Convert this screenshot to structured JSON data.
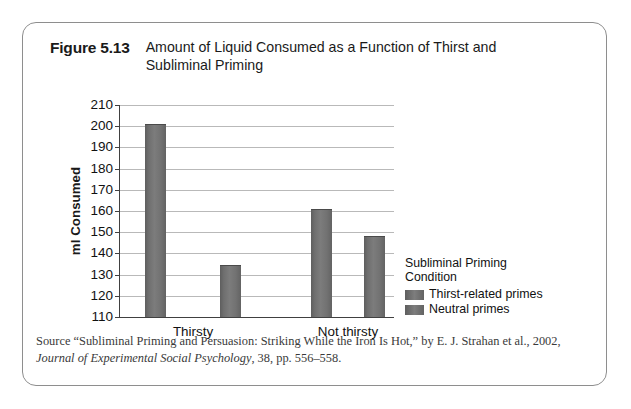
{
  "figure": {
    "number": "Figure 5.13",
    "title": "Amount of Liquid Consumed as a Function of Thirst and Subliminal Priming"
  },
  "source": {
    "lead": "Source “Subliminal Priming and Persuasion: Striking While the Iron Is Hot,” by E. J. Strahan et al., 2002,",
    "journal": "Journal of Experimental Social Psychology",
    "tail": ", 38, pp. 556–558."
  },
  "legend": {
    "title_line1": "Subliminal Priming",
    "title_line2": "Condition",
    "items": [
      {
        "label": "Thirst-related primes",
        "color": "#6f6f6f"
      },
      {
        "label": "Neutral primes",
        "color": "#6f6f6f"
      }
    ]
  },
  "chart_data": {
    "type": "bar",
    "title": "Amount of Liquid Consumed as a Function of Thirst and Subliminal Priming",
    "xlabel": "",
    "ylabel": "ml Consumed",
    "ylim": [
      110,
      210
    ],
    "yticks": [
      110,
      120,
      130,
      140,
      150,
      160,
      170,
      180,
      190,
      200,
      210
    ],
    "grid": true,
    "legend_position": "right",
    "categories": [
      "Thirsty",
      "Not thirsty"
    ],
    "series": [
      {
        "name": "Thirst-related primes",
        "values": [
          201,
          161
        ]
      },
      {
        "name": "Neutral primes",
        "values": [
          134.5,
          148
        ]
      }
    ]
  }
}
